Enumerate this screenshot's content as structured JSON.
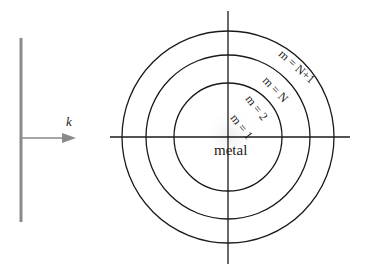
{
  "diagram": {
    "incident_wave": {
      "wavevector_label": "k",
      "colors": {
        "wavefront": "#8a8a8a",
        "arrow": "#8a8a8a"
      }
    },
    "center_label": "metal",
    "rings": [
      {
        "label": "m = 1",
        "radius": 0
      },
      {
        "label": "m = 2",
        "radius": 53
      },
      {
        "label": "m = N",
        "radius": 81
      },
      {
        "label": "m = N+1",
        "radius": 105
      }
    ],
    "colors": {
      "lines": "#1a1a1a",
      "center_glow": "#f0f0f0"
    }
  }
}
